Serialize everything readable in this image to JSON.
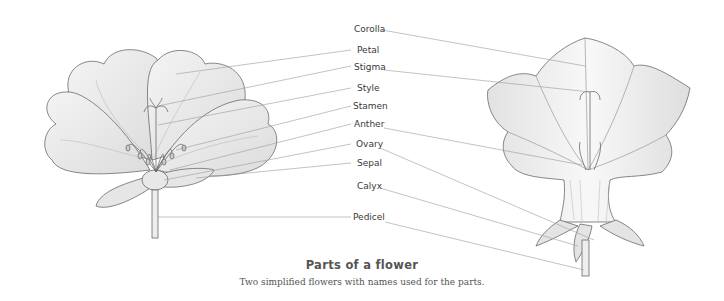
{
  "figure": {
    "title": "Parts of a flower",
    "caption": "Two simplified flowers with names used for the parts."
  },
  "labels": [
    {
      "id": "corolla",
      "text": "Corolla"
    },
    {
      "id": "petal",
      "text": "Petal"
    },
    {
      "id": "stigma",
      "text": "Stigma"
    },
    {
      "id": "style",
      "text": "Style"
    },
    {
      "id": "stamen",
      "text": "Stamen"
    },
    {
      "id": "anther",
      "text": "Anther"
    },
    {
      "id": "ovary",
      "text": "Ovary"
    },
    {
      "id": "sepal",
      "text": "Sepal"
    },
    {
      "id": "calyx",
      "text": "Calyx"
    },
    {
      "id": "pedicel",
      "text": "Pedicel"
    }
  ],
  "colors": {
    "ink": "#555555",
    "line": "#9a9a9a",
    "text": "#3a3a3a"
  }
}
